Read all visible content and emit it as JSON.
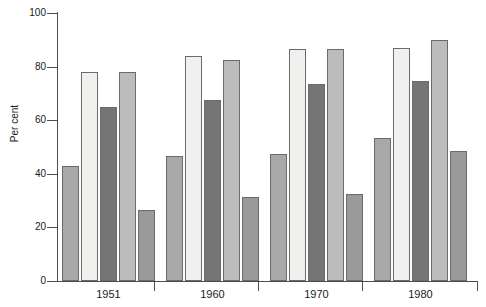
{
  "chart_data": {
    "type": "bar",
    "title": "",
    "xlabel": "",
    "ylabel": "Per cent",
    "ylim": [
      0,
      100
    ],
    "yticks": [
      0,
      20,
      40,
      60,
      80,
      100
    ],
    "ytick_labels": [
      "0",
      "20",
      "40",
      "60",
      "80",
      "100"
    ],
    "grid": false,
    "legend": "none",
    "categories": [
      "1951",
      "1960",
      "1970",
      "1980"
    ],
    "series": [
      {
        "name": "Series 1",
        "color": "#a8a8a8",
        "values": [
          43,
          46.5,
          47.5,
          53.5
        ]
      },
      {
        "name": "Series 2",
        "color": "#f0f0ee",
        "values": [
          78,
          84,
          86.5,
          87
        ]
      },
      {
        "name": "Series 3",
        "color": "#757575",
        "values": [
          65,
          67.5,
          73.5,
          74.5
        ]
      },
      {
        "name": "Series 4",
        "color": "#bcbcbc",
        "values": [
          78,
          82.5,
          86.5,
          90
        ]
      },
      {
        "name": "Series 5",
        "color": "#9a9a9a",
        "values": [
          26.5,
          31.5,
          32.5,
          48.5
        ]
      }
    ]
  },
  "axis": {
    "y_title": "Per cent"
  }
}
